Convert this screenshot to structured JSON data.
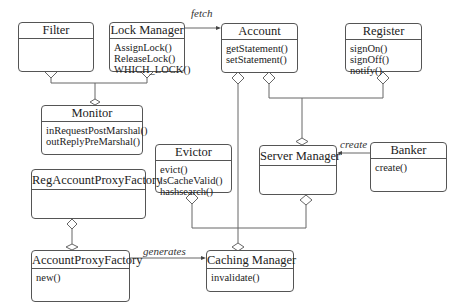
{
  "diagram": {
    "type": "UML class diagram",
    "classes": [
      {
        "id": "filter",
        "name": "Filter",
        "operations": []
      },
      {
        "id": "lock_manager",
        "name": "Lock Manager",
        "operations": [
          "AssignLock()",
          "ReleaseLock()",
          "WHICH_LOCK()"
        ]
      },
      {
        "id": "account",
        "name": "Account",
        "operations": [
          "getStatement()",
          "setStatement()"
        ]
      },
      {
        "id": "register",
        "name": "Register",
        "operations": [
          "signOn()",
          "signOff()",
          "notify()"
        ]
      },
      {
        "id": "monitor",
        "name": "Monitor",
        "operations": [
          "inRequestPostMarshal()",
          "outReplyPreMarshal()"
        ]
      },
      {
        "id": "evictor",
        "name": "Evictor",
        "operations": [
          "evict()",
          "isCacheValid()",
          "hashsearch()"
        ]
      },
      {
        "id": "server_manager",
        "name": "Server Manager",
        "operations": []
      },
      {
        "id": "banker",
        "name": "Banker",
        "operations": [
          "create()"
        ]
      },
      {
        "id": "reg_account_proxy_factory",
        "name": "RegAccountProxyFactory",
        "operations": []
      },
      {
        "id": "account_proxy_factory",
        "name": "AccountProxyFactory",
        "operations": [
          "new()"
        ]
      },
      {
        "id": "caching_manager",
        "name": "Caching Manager",
        "operations": [
          "invalidate()"
        ]
      }
    ],
    "associations": [
      {
        "from": "Lock Manager",
        "to": "Account",
        "label": "fetch",
        "kind": "directed"
      },
      {
        "from": "Banker",
        "to": "Server Manager",
        "label": "create",
        "kind": "directed"
      },
      {
        "from": "AccountProxyFactory",
        "to": "Caching Manager",
        "label": "generates",
        "kind": "directed"
      },
      {
        "whole": "Filter",
        "part": "Monitor",
        "kind": "aggregation"
      },
      {
        "whole": "Lock Manager",
        "part": "Monitor",
        "kind": "aggregation"
      },
      {
        "whole": "Account",
        "part": "Server Manager",
        "kind": "aggregation"
      },
      {
        "whole": "Register",
        "part": "Server Manager",
        "kind": "aggregation"
      },
      {
        "whole": "Account",
        "part": "Caching Manager",
        "kind": "aggregation"
      },
      {
        "whole": "Evictor",
        "part": "Caching Manager",
        "kind": "aggregation"
      },
      {
        "whole": "Server Manager",
        "part": "Caching Manager",
        "kind": "aggregation"
      },
      {
        "whole": "RegAccountProxyFactory",
        "part": "AccountProxyFactory",
        "kind": "aggregation"
      }
    ],
    "labels": {
      "fetch": "fetch",
      "create": "create",
      "generates": "generates"
    }
  }
}
